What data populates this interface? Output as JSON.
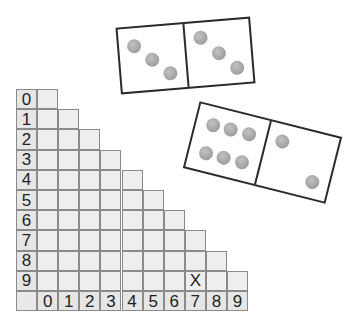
{
  "dominoes": [
    {
      "id": "domino-a",
      "halves": [
        3,
        3
      ],
      "pip_color": "#a6a6a6",
      "border_color": "#2a2a2a"
    },
    {
      "id": "domino-b",
      "halves": [
        6,
        2
      ],
      "pip_color": "#a6a6a6",
      "border_color": "#2a2a2a"
    }
  ],
  "grid": {
    "row_labels": [
      "0",
      "1",
      "2",
      "3",
      "4",
      "5",
      "6",
      "7",
      "8",
      "9"
    ],
    "col_labels": [
      "0",
      "1",
      "2",
      "3",
      "4",
      "5",
      "6",
      "7",
      "8",
      "9"
    ],
    "shape": "lower-triangular: row r has columns 0..r",
    "marks": [
      {
        "row": 9,
        "col": 7,
        "text": "X"
      }
    ],
    "cell_fill": "#eeeeee",
    "line_color": "#8a8a8a"
  }
}
